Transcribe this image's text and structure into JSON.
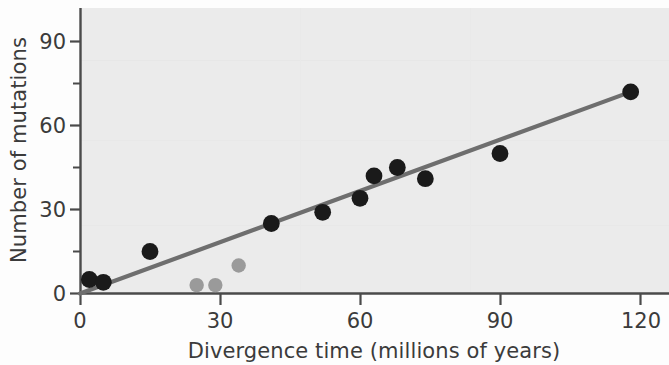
{
  "chart_data": {
    "type": "scatter",
    "title": "",
    "xlabel": "Divergence time (millions of years)",
    "ylabel": "Number of mutations",
    "xlim": [
      0,
      127
    ],
    "ylim": [
      0,
      100
    ],
    "xticks": [
      0,
      30,
      60,
      90,
      120
    ],
    "xtick_labels": [
      "0",
      "30",
      "60",
      "90",
      "120"
    ],
    "x_minor_ticks": [
      15,
      45,
      75,
      105
    ],
    "yticks": [
      0,
      30,
      60,
      90
    ],
    "ytick_labels": [
      "0",
      "30",
      "60",
      "90"
    ],
    "y_minor_ticks": [
      15,
      45,
      75
    ],
    "grid": false,
    "legend": null,
    "plot_background": "#ebebeb",
    "series": [
      {
        "name": "primary-samples",
        "marker": "circle",
        "color": "#1a1a1a",
        "points": [
          {
            "x": 2,
            "y": 5
          },
          {
            "x": 5,
            "y": 4
          },
          {
            "x": 15,
            "y": 15
          },
          {
            "x": 41,
            "y": 25
          },
          {
            "x": 52,
            "y": 29
          },
          {
            "x": 60,
            "y": 34
          },
          {
            "x": 63,
            "y": 42
          },
          {
            "x": 68,
            "y": 45
          },
          {
            "x": 74,
            "y": 41
          },
          {
            "x": 90,
            "y": 50
          },
          {
            "x": 118,
            "y": 72
          }
        ]
      },
      {
        "name": "secondary-samples",
        "marker": "circle",
        "color": "#9a9a9a",
        "points": [
          {
            "x": 25,
            "y": 3
          },
          {
            "x": 29,
            "y": 3
          },
          {
            "x": 34,
            "y": 10
          }
        ]
      }
    ],
    "trendline": {
      "name": "regression-line",
      "color": "#6e6e6e",
      "x_start": 0,
      "y_start": 0,
      "x_end": 118,
      "y_end": 72,
      "slope": 0.61,
      "intercept": 0
    }
  },
  "axes": {
    "x_label": "Divergence time (millions of years)",
    "y_label": "Number of mutations",
    "x_tick_labels": [
      "0",
      "30",
      "60",
      "90",
      "120"
    ],
    "y_tick_labels": [
      "0",
      "30",
      "60",
      "90"
    ],
    "axis_color": "#4a4a4a"
  }
}
